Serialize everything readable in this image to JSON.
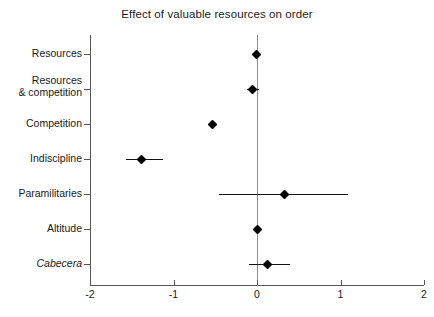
{
  "chart_data": {
    "type": "scatter",
    "subtype": "coefficient-forest-plot",
    "title": "Effect of valuable resources on order",
    "xlabel": "",
    "ylabel": "",
    "xlim": [
      -2,
      2
    ],
    "xticks": [
      -2,
      -1,
      0,
      1,
      2
    ],
    "xticklabels": [
      "-2",
      "-1",
      "0",
      "1",
      "2"
    ],
    "grid": false,
    "legend": null,
    "reference_line": {
      "x": 0,
      "color": "#8c8c8c",
      "style": "solid"
    },
    "categories": [
      "Resources",
      "Resources\n& competition",
      "Competition",
      "Indiscipline",
      "Paramilitaries",
      "Altitude",
      "Cabecera"
    ],
    "points": [
      {
        "label": "Resources",
        "estimate": -0.01,
        "ci_low": -0.05,
        "ci_high": 0.03,
        "italic": false
      },
      {
        "label": "Resources\n& competition",
        "estimate": -0.05,
        "ci_low": -0.12,
        "ci_high": 0.02,
        "italic": false
      },
      {
        "label": "Competition",
        "estimate": -0.53,
        "ci_low": -0.57,
        "ci_high": -0.49,
        "italic": false
      },
      {
        "label": "Indiscipline",
        "estimate": -1.38,
        "ci_low": -1.57,
        "ci_high": -1.12,
        "italic": false
      },
      {
        "label": "Paramilitaries",
        "estimate": 0.33,
        "ci_low": -0.46,
        "ci_high": 1.09,
        "italic": false
      },
      {
        "label": "Altitude",
        "estimate": 0.0,
        "ci_low": -0.04,
        "ci_high": 0.04,
        "italic": false
      },
      {
        "label": "Cabecera",
        "estimate": 0.13,
        "ci_low": -0.09,
        "ci_high": 0.39,
        "italic": true
      }
    ],
    "colors": {
      "marker": "#000000",
      "ci": "#111111",
      "axis": "#555555",
      "reference": "#8c8c8c",
      "background": "#ffffff",
      "text": "#1a1a1a"
    }
  }
}
